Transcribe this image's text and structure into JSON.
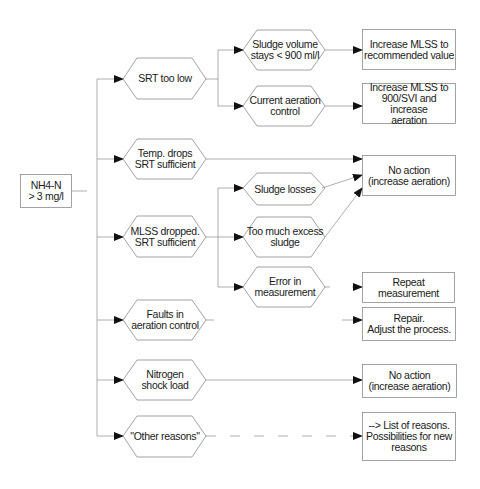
{
  "root": {
    "id": "root",
    "label": "NH4-N\n> 3 mg/l"
  },
  "causes": [
    {
      "id": "srt-too-low",
      "label": "SRT  too low"
    },
    {
      "id": "temp-drops",
      "label": "Temp.  drops\nSRT sufficient"
    },
    {
      "id": "mlss-dropped",
      "label": "MLSS dropped.\nSRT sufficient"
    },
    {
      "id": "faults-aeration",
      "label": "Faults in\naeration control"
    },
    {
      "id": "nitrogen-shock",
      "label": "Nitrogen\nshock load"
    },
    {
      "id": "other-reasons",
      "label": "\"Other reasons\""
    }
  ],
  "sub_causes": [
    {
      "id": "sludge-volume",
      "parent": "srt-too-low",
      "label": "Sludge volume\nstays < 900 ml/l"
    },
    {
      "id": "current-aeration",
      "parent": "srt-too-low",
      "label": "Current aeration\ncontrol"
    },
    {
      "id": "sludge-losses",
      "parent": "mlss-dropped",
      "label": "Sludge losses"
    },
    {
      "id": "excess-sludge",
      "parent": "mlss-dropped",
      "label": "Too much excess\nsludge"
    },
    {
      "id": "error-measurement",
      "parent": "mlss-dropped",
      "label": "Error in\nmeasurement"
    }
  ],
  "actions": [
    {
      "id": "increase-mlss-recommended",
      "label": "Increase MLSS to\nrecommended value"
    },
    {
      "id": "increase-mlss-svi",
      "label": "Increase MLSS to\n900/SVI and increase\naeration"
    },
    {
      "id": "no-action-1",
      "label": "No action\n(increase aeration)"
    },
    {
      "id": "repeat-measurement",
      "label": "Repeat measurement"
    },
    {
      "id": "repair",
      "label": "Repair.\nAdjust the process."
    },
    {
      "id": "no-action-2",
      "label": "No action\n(increase aeration)"
    },
    {
      "id": "list-reasons",
      "label": "--> List of reasons.\nPossibilities for new\nreasons"
    }
  ],
  "colors": {
    "line": "#9a9a9a",
    "box_border": "#8c8c8c",
    "arrow": "#111111",
    "text": "#1a1a1a",
    "background": "#ffffff"
  }
}
